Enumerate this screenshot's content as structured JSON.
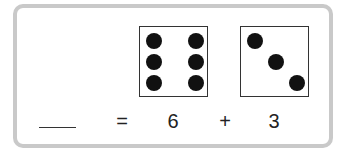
{
  "problem": {
    "answer_blank": "",
    "equals": "=",
    "addend1": "6",
    "plus": "+",
    "addend2": "3"
  },
  "dice": [
    {
      "value": 6,
      "label": "six-dot die"
    },
    {
      "value": 3,
      "label": "three-dot die"
    }
  ],
  "colors": {
    "border": "#c9c9c9",
    "dot": "#111111",
    "text": "#222222"
  }
}
